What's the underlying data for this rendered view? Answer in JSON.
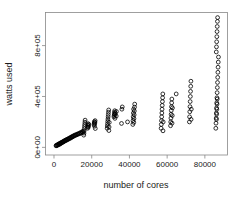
{
  "chart_data": {
    "type": "scatter",
    "title": "",
    "xlabel": "number of cores",
    "ylabel": "watts used",
    "xlim": [
      -4500,
      92000
    ],
    "ylim": [
      -60000,
      1060000
    ],
    "grid": false,
    "legend": null,
    "marker": "open-circle",
    "xticks": [
      0,
      20000,
      40000,
      60000,
      80000
    ],
    "xticklabels": [
      "0",
      "20000",
      "40000",
      "60000",
      "80000"
    ],
    "yticks": [
      0,
      400000,
      800000
    ],
    "yticklabels": [
      "0e+00",
      "4e+05",
      "8e+05"
    ],
    "points": [
      [
        1100,
        12000
      ],
      [
        1200,
        16000
      ],
      [
        1500,
        14000
      ],
      [
        1800,
        20000
      ],
      [
        2000,
        18000
      ],
      [
        2200,
        24000
      ],
      [
        2400,
        21000
      ],
      [
        2600,
        28000
      ],
      [
        2900,
        25000
      ],
      [
        3100,
        31000
      ],
      [
        3300,
        27000
      ],
      [
        3500,
        35000
      ],
      [
        3800,
        33000
      ],
      [
        4000,
        39000
      ],
      [
        4200,
        36000
      ],
      [
        4500,
        43000
      ],
      [
        4800,
        41000
      ],
      [
        5000,
        47000
      ],
      [
        5200,
        45000
      ],
      [
        5500,
        52000
      ],
      [
        5800,
        50000
      ],
      [
        6000,
        56000
      ],
      [
        6300,
        54000
      ],
      [
        6600,
        61000
      ],
      [
        6900,
        58000
      ],
      [
        7200,
        65000
      ],
      [
        7500,
        63000
      ],
      [
        7800,
        70000
      ],
      [
        8100,
        68000
      ],
      [
        8400,
        75000
      ],
      [
        8700,
        72000
      ],
      [
        9000,
        80000
      ],
      [
        9300,
        78000
      ],
      [
        9600,
        85000
      ],
      [
        9900,
        83000
      ],
      [
        10200,
        90000
      ],
      [
        10500,
        88000
      ],
      [
        10900,
        95000
      ],
      [
        11200,
        93000
      ],
      [
        11600,
        100000
      ],
      [
        12000,
        98000
      ],
      [
        12400,
        105000
      ],
      [
        12800,
        103000
      ],
      [
        13200,
        110000
      ],
      [
        13600,
        108000
      ],
      [
        14000,
        116000
      ],
      [
        14400,
        112000
      ],
      [
        14800,
        122000
      ],
      [
        15200,
        118000
      ],
      [
        15500,
        128000
      ],
      [
        15800,
        96000
      ],
      [
        15900,
        112000
      ],
      [
        16000,
        130000
      ],
      [
        16100,
        148000
      ],
      [
        16200,
        165000
      ],
      [
        16300,
        181000
      ],
      [
        16400,
        198000
      ],
      [
        16500,
        214000
      ],
      [
        17800,
        150000
      ],
      [
        17900,
        162000
      ],
      [
        18000,
        174000
      ],
      [
        18100,
        186000
      ],
      [
        18200,
        158000
      ],
      [
        18300,
        170000
      ],
      [
        18400,
        182000
      ],
      [
        21200,
        178000
      ],
      [
        21300,
        190000
      ],
      [
        21400,
        202000
      ],
      [
        21500,
        166000
      ],
      [
        21600,
        186000
      ],
      [
        21700,
        198000
      ],
      [
        21800,
        210000
      ],
      [
        21900,
        148000
      ],
      [
        28200,
        150000
      ],
      [
        28300,
        168000
      ],
      [
        28400,
        186000
      ],
      [
        28500,
        204000
      ],
      [
        28600,
        222000
      ],
      [
        28700,
        240000
      ],
      [
        28800,
        258000
      ],
      [
        28900,
        276000
      ],
      [
        29000,
        294000
      ],
      [
        29100,
        132000
      ],
      [
        29200,
        160000
      ],
      [
        29300,
        196000
      ],
      [
        31800,
        240000
      ],
      [
        31900,
        252000
      ],
      [
        32000,
        264000
      ],
      [
        32100,
        276000
      ],
      [
        32200,
        288000
      ],
      [
        32300,
        228000
      ],
      [
        32400,
        258000
      ],
      [
        32500,
        270000
      ],
      [
        33000,
        246000
      ],
      [
        33100,
        282000
      ],
      [
        35800,
        188000
      ],
      [
        36000,
        300000
      ],
      [
        36200,
        318000
      ],
      [
        39000,
        200000
      ],
      [
        41800,
        180000
      ],
      [
        41900,
        210000
      ],
      [
        42000,
        240000
      ],
      [
        42100,
        270000
      ],
      [
        42200,
        300000
      ],
      [
        42300,
        196000
      ],
      [
        42400,
        226000
      ],
      [
        42500,
        256000
      ],
      [
        42600,
        286000
      ],
      [
        42700,
        316000
      ],
      [
        42800,
        340000
      ],
      [
        56800,
        150000
      ],
      [
        56900,
        180000
      ],
      [
        57000,
        210000
      ],
      [
        57100,
        240000
      ],
      [
        57200,
        270000
      ],
      [
        57300,
        300000
      ],
      [
        57400,
        330000
      ],
      [
        57500,
        360000
      ],
      [
        57600,
        390000
      ],
      [
        57700,
        420000
      ],
      [
        57800,
        130000
      ],
      [
        57900,
        200000
      ],
      [
        61800,
        170000
      ],
      [
        61900,
        200000
      ],
      [
        62000,
        230000
      ],
      [
        62100,
        260000
      ],
      [
        62200,
        290000
      ],
      [
        62300,
        320000
      ],
      [
        62400,
        350000
      ],
      [
        62500,
        380000
      ],
      [
        62600,
        190000
      ],
      [
        62700,
        250000
      ],
      [
        62800,
        310000
      ],
      [
        64800,
        420000
      ],
      [
        71800,
        200000
      ],
      [
        71900,
        240000
      ],
      [
        72000,
        280000
      ],
      [
        72100,
        320000
      ],
      [
        72200,
        360000
      ],
      [
        72300,
        400000
      ],
      [
        72400,
        440000
      ],
      [
        72500,
        480000
      ],
      [
        72600,
        520000
      ],
      [
        72700,
        220000
      ],
      [
        72800,
        300000
      ],
      [
        85800,
        150000
      ],
      [
        85900,
        190000
      ],
      [
        86000,
        230000
      ],
      [
        86100,
        270000
      ],
      [
        86200,
        310000
      ],
      [
        86300,
        350000
      ],
      [
        86400,
        390000
      ],
      [
        86500,
        430000
      ],
      [
        86600,
        470000
      ],
      [
        86700,
        510000
      ],
      [
        86800,
        550000
      ],
      [
        86900,
        590000
      ],
      [
        87000,
        630000
      ],
      [
        87100,
        670000
      ],
      [
        87200,
        710000
      ],
      [
        86050,
        750000
      ],
      [
        86150,
        790000
      ],
      [
        86250,
        830000
      ],
      [
        86350,
        870000
      ],
      [
        86450,
        910000
      ],
      [
        86550,
        950000
      ],
      [
        86650,
        990000
      ],
      [
        86750,
        1020000
      ],
      [
        86350,
        300000
      ],
      [
        86450,
        340000
      ],
      [
        86250,
        260000
      ],
      [
        86550,
        380000
      ],
      [
        86150,
        220000
      ]
    ]
  }
}
